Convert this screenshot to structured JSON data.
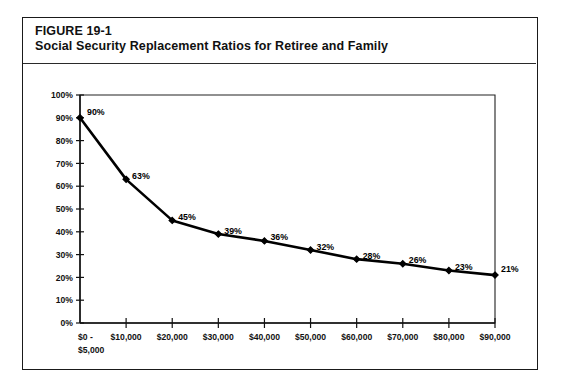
{
  "figure": {
    "label": "FIGURE 19-1",
    "title": "Social Security Replacement Ratios for Retiree and Family"
  },
  "chart_data": {
    "type": "line",
    "title": "Social Security Replacement Ratios for Retiree and Family",
    "xlabel": "",
    "ylabel": "",
    "categories": [
      "$0 - $5,000",
      "$10,000",
      "$20,000",
      "$30,000",
      "$40,000",
      "$50,000",
      "$60,000",
      "$70,000",
      "$80,000",
      "$90,000"
    ],
    "values": [
      90,
      63,
      45,
      39,
      36,
      32,
      28,
      26,
      23,
      21
    ],
    "point_labels": [
      "90%",
      "63%",
      "45%",
      "39%",
      "36%",
      "32%",
      "28%",
      "26%",
      "23%",
      "21%"
    ],
    "ylim": [
      0,
      100
    ],
    "ytick_labels": [
      "0%",
      "10%",
      "20%",
      "30%",
      "40%",
      "50%",
      "60%",
      "70%",
      "80%",
      "90%",
      "100%"
    ],
    "ytick_values": [
      0,
      10,
      20,
      30,
      40,
      50,
      60,
      70,
      80,
      90,
      100
    ],
    "grid": false,
    "legend": false,
    "series_color": "#000000",
    "marker": "filled-diamond"
  },
  "xaxis": {
    "first_label_line1": "$0 -",
    "first_label_line2": "$5,000"
  }
}
